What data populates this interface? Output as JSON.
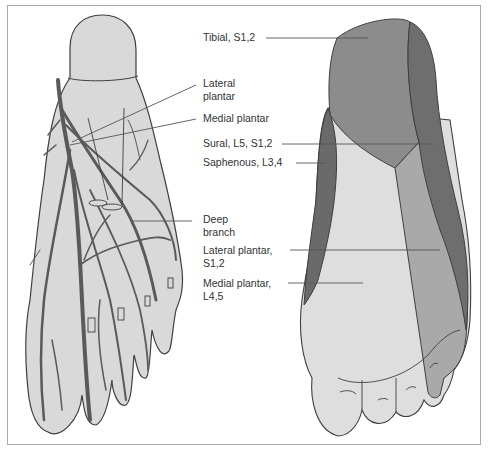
{
  "figure": {
    "left_panel": {
      "description": "Plantar nerves of the foot (sole view)",
      "labels": [
        {
          "id": "lateral-plantar",
          "lines": [
            "Lateral",
            "plantar"
          ]
        },
        {
          "id": "medial-plantar",
          "lines": [
            "Medial plantar"
          ]
        },
        {
          "id": "deep-branch",
          "lines": [
            "Deep",
            "branch"
          ]
        }
      ]
    },
    "right_panel": {
      "description": "Cutaneous innervation of the sole",
      "labels": [
        {
          "id": "tibial",
          "lines": [
            "Tibial, S1,2"
          ]
        },
        {
          "id": "sural",
          "lines": [
            "Sural, L5, S1,2"
          ]
        },
        {
          "id": "saphenous",
          "lines": [
            "Saphenous, L3,4"
          ]
        },
        {
          "id": "lateral-plantar",
          "lines": [
            "Lateral plantar,",
            "S1,2"
          ]
        },
        {
          "id": "medial-plantar",
          "lines": [
            "Medial plantar,",
            "L4,5"
          ]
        }
      ]
    }
  },
  "colors": {
    "frame": "#a9a9a9",
    "foot_fill": "#d9d9d9",
    "outline": "#3f3f3f",
    "nerve": "#5a5a5a",
    "tibial": "#8c8c8c",
    "sural": "#6e6e6e",
    "saphenous": "#6a6a6a",
    "lateral_plantar": "#a9a9a9",
    "medial_plantar": "#dedede",
    "leader": "#555555"
  }
}
